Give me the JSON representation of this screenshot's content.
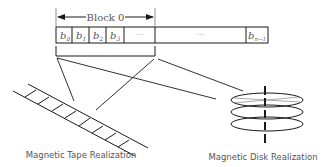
{
  "diagram": {
    "block_label": "Block 0",
    "cells": [
      {
        "base": "b",
        "sub": "0"
      },
      {
        "base": "b",
        "sub": "1"
      },
      {
        "base": "b",
        "sub": "2"
      },
      {
        "base": "b",
        "sub": "3"
      },
      {
        "ellipsis": "···"
      },
      {
        "ellipsis": "···"
      },
      {
        "base": "b",
        "sub": "n−1"
      }
    ],
    "tape_label": "Magnetic Tape Realization",
    "disk_label": "Magnetic Disk Realization",
    "colors": {
      "line": "#1a1a1a",
      "text": "#555555",
      "dots": "#999999"
    }
  }
}
